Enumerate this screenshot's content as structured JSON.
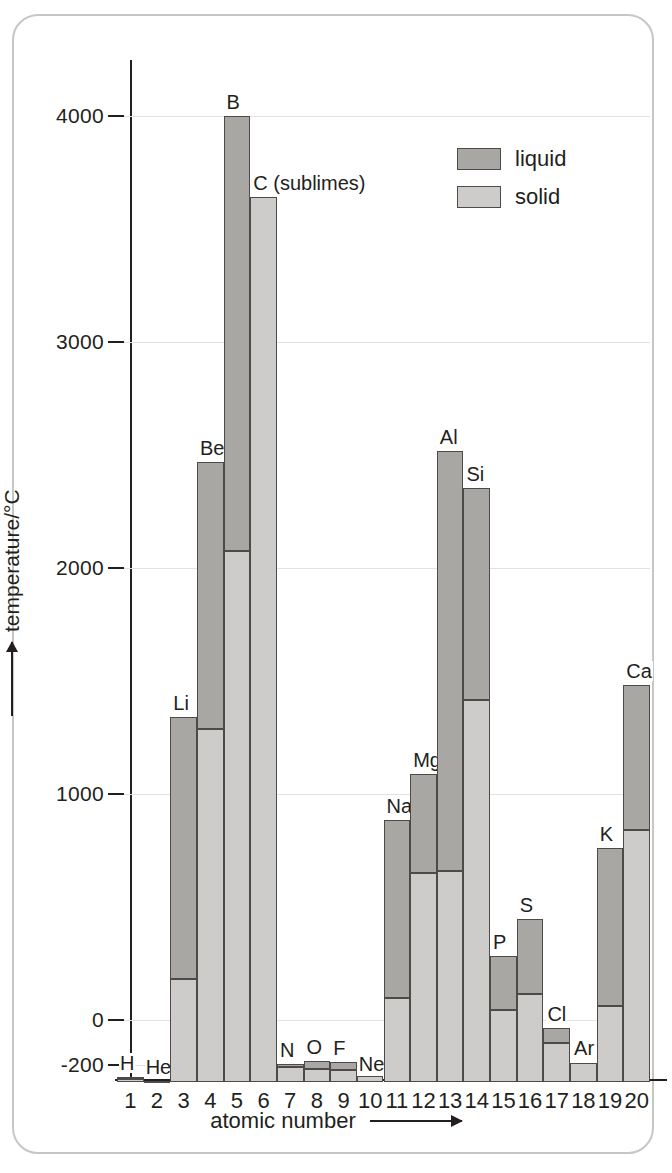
{
  "chart_data": {
    "type": "bar",
    "title": "",
    "xlabel": "atomic number",
    "ylabel": "temperature/°C",
    "ylim": [
      -273,
      4200
    ],
    "yticks": [
      4000,
      3000,
      2000,
      1000,
      0,
      -200
    ],
    "ytick_labels": [
      "4000",
      "3000",
      "2000",
      "1000",
      "0",
      "-200"
    ],
    "grid": true,
    "legend_position": "top-right",
    "legend": [
      {
        "key": "liquid",
        "label": "liquid",
        "color": "#a9a7a4"
      },
      {
        "key": "solid",
        "label": "solid",
        "color": "#cecccb"
      }
    ],
    "stacking": "melting point then boiling point",
    "baseline": -273,
    "categories": [
      1,
      2,
      3,
      4,
      5,
      6,
      7,
      8,
      9,
      10,
      11,
      12,
      13,
      14,
      15,
      16,
      17,
      18,
      19,
      20
    ],
    "xtick_labels": [
      "1",
      "2",
      "3",
      "4",
      "5",
      "6",
      "7",
      "8",
      "9",
      "10",
      "11",
      "12",
      "13",
      "14",
      "15",
      "16",
      "17",
      "18",
      "19",
      "20"
    ],
    "points": [
      {
        "z": 1,
        "symbol": "H",
        "melting": -259,
        "boiling": -253
      },
      {
        "z": 2,
        "symbol": "He",
        "melting": -272,
        "boiling": -269
      },
      {
        "z": 3,
        "symbol": "Li",
        "melting": 180,
        "boiling": 1342
      },
      {
        "z": 4,
        "symbol": "Be",
        "melting": 1287,
        "boiling": 2470
      },
      {
        "z": 5,
        "symbol": "B",
        "melting": 2075,
        "boiling": 4000
      },
      {
        "z": 6,
        "symbol": "C (sublimes)",
        "melting": 3642,
        "boiling": 3642
      },
      {
        "z": 7,
        "symbol": "N",
        "melting": -210,
        "boiling": -196
      },
      {
        "z": 8,
        "symbol": "O",
        "melting": -218,
        "boiling": -183
      },
      {
        "z": 9,
        "symbol": "F",
        "melting": -220,
        "boiling": -188
      },
      {
        "z": 10,
        "symbol": "Ne",
        "melting": -249,
        "boiling": -246
      },
      {
        "z": 11,
        "symbol": "Na",
        "melting": 98,
        "boiling": 883
      },
      {
        "z": 12,
        "symbol": "Mg",
        "melting": 650,
        "boiling": 1090
      },
      {
        "z": 13,
        "symbol": "Al",
        "melting": 660,
        "boiling": 2519
      },
      {
        "z": 14,
        "symbol": "Si",
        "melting": 1414,
        "boiling": 2355
      },
      {
        "z": 15,
        "symbol": "P",
        "melting": 44,
        "boiling": 281
      },
      {
        "z": 16,
        "symbol": "S",
        "melting": 115,
        "boiling": 445
      },
      {
        "z": 17,
        "symbol": "Cl",
        "melting": -101,
        "boiling": -34
      },
      {
        "z": 18,
        "symbol": "Ar",
        "melting": -189,
        "boiling": -186
      },
      {
        "z": 19,
        "symbol": "K",
        "melting": 63,
        "boiling": 759
      },
      {
        "z": 20,
        "symbol": "Ca",
        "melting": 842,
        "boiling": 1484
      }
    ]
  }
}
